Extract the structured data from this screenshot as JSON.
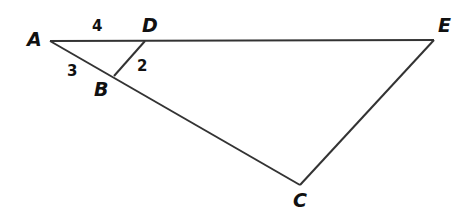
{
  "diagram": {
    "points": {
      "A": {
        "label": "A",
        "x": 50,
        "y": 41
      },
      "D": {
        "label": "D",
        "x": 145,
        "y": 41
      },
      "E": {
        "label": "E",
        "x": 434,
        "y": 40
      },
      "B": {
        "label": "B",
        "x": 114,
        "y": 76
      },
      "C": {
        "label": "C",
        "x": 300,
        "y": 185
      }
    },
    "segments": [
      {
        "from": "A",
        "to": "E"
      },
      {
        "from": "A",
        "to": "C"
      },
      {
        "from": "D",
        "to": "B"
      },
      {
        "from": "E",
        "to": "C"
      }
    ],
    "measures": {
      "AD": "4",
      "AB": "3",
      "DB": "2"
    },
    "colors": {
      "stroke": "#333333",
      "text": "#111111"
    }
  }
}
